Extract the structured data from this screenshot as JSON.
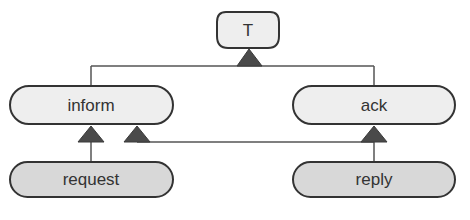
{
  "diagram": {
    "type": "inheritance-hierarchy",
    "colors": {
      "background": "#ffffff",
      "line": "#555555",
      "arrow_fill": "#4a4a4a",
      "parent_fill": "#eeeeee",
      "leaf_fill": "#d8d8d8",
      "border": "#333333",
      "text": "#333333"
    },
    "nodes": {
      "root": {
        "label": "T"
      },
      "inform": {
        "label": "inform"
      },
      "ack": {
        "label": "ack"
      },
      "request": {
        "label": "request"
      },
      "reply": {
        "label": "reply"
      }
    },
    "edges": [
      {
        "from": "inform",
        "to": "T",
        "kind": "generalization"
      },
      {
        "from": "ack",
        "to": "T",
        "kind": "generalization"
      },
      {
        "from": "request",
        "to": "inform",
        "kind": "generalization"
      },
      {
        "from": "reply",
        "to": "inform",
        "kind": "generalization"
      },
      {
        "from": "reply",
        "to": "ack",
        "kind": "generalization"
      }
    ]
  }
}
